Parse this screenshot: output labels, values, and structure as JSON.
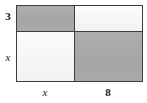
{
  "figure": {
    "type": "area-model-rectangle",
    "colors": {
      "shaded_fill": "#a8a8a8",
      "light_fill": "#f4f4f2",
      "stroke": "#3d3d3d",
      "text": "#1a1a1a",
      "background": "#ffffff"
    }
  },
  "dimensions": {
    "left_top": "3",
    "left_bottom": "x",
    "bottom_left": "x",
    "bottom_right": "8"
  },
  "regions": [
    {
      "id": "top-left",
      "fill": "shaded",
      "width_label": "x",
      "height_label": "3"
    },
    {
      "id": "top-right",
      "fill": "light",
      "width_label": "8",
      "height_label": "3"
    },
    {
      "id": "bottom-left",
      "fill": "light",
      "width_label": "x",
      "height_label": "x"
    },
    {
      "id": "bottom-right",
      "fill": "shaded",
      "width_label": "8",
      "height_label": "x"
    }
  ]
}
